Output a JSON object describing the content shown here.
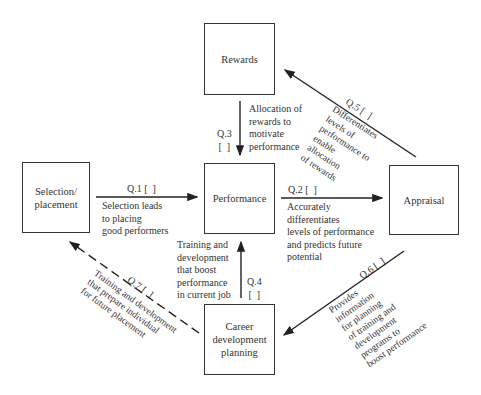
{
  "nodes": {
    "rewards": "Rewards",
    "performance": "Performance",
    "selection": "Selection/\nplacement",
    "appraisal": "Appraisal",
    "career": "Career\ndevelopment\nplanning"
  },
  "edges": {
    "q1": {
      "tag": "Q.1 [  ]",
      "text": "Selection leads\nto placing\ngood performers"
    },
    "q2": {
      "tag": "Q.2 [  ]",
      "text": "Accurately\ndifferentiates\nlevels of performance\nand predicts future\npotential"
    },
    "q3": {
      "tag": "Q.3\n[  ]",
      "text": "Allocation of\nrewards to\nmotivate\nperformance"
    },
    "q4": {
      "tag": "Q.4\n[  ]",
      "text": "Training and\ndevelopment\nthat boost\nperformance\nin current job"
    },
    "q5": {
      "tag": "Q.5 [  ]",
      "text": "Differentiates\nlevels of\nperformance to\nenable\nallocation\nof rewards"
    },
    "q6": {
      "tag": "Q.6 [  ]",
      "text": "Provides\ninformation\nfor planning\nof training and\ndevelopment\nprograms to\nboost performance"
    },
    "q7": {
      "tag": "Q.7 [  ]",
      "text": "Training and development\nthat prepare individual\nfor future placement"
    }
  }
}
